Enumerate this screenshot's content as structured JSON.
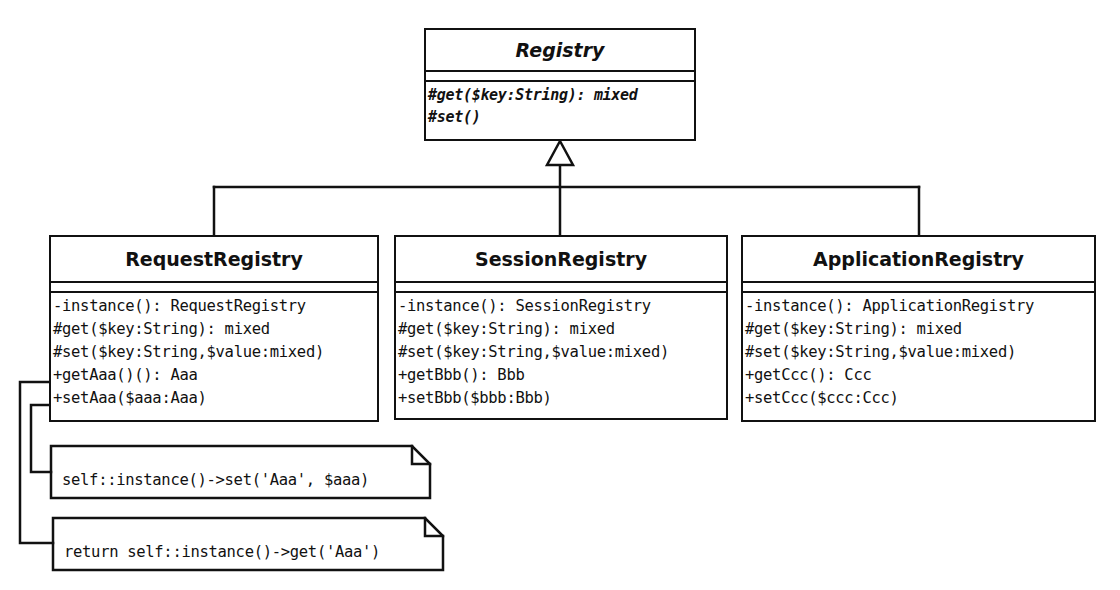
{
  "diagram": {
    "type": "UML class diagram",
    "colors": {
      "stroke": "#111111",
      "fill": "#ffffff"
    },
    "classes": {
      "registry": {
        "name": "Registry",
        "abstract": true,
        "operations": [
          "#get($key:String): mixed",
          "#set()"
        ]
      },
      "request": {
        "name": "RequestRegistry",
        "operations": [
          "-instance(): RequestRegistry",
          "#get($key:String): mixed",
          "#set($key:String,$value:mixed)",
          "+getAaa()(): Aaa",
          "+setAaa($aaa:Aaa)"
        ]
      },
      "session": {
        "name": "SessionRegistry",
        "operations": [
          "-instance(): SessionRegistry",
          "#get($key:String): mixed",
          "#set($key:String,$value:mixed)",
          "+getBbb(): Bbb",
          "+setBbb($bbb:Bbb)"
        ]
      },
      "application": {
        "name": "ApplicationRegistry",
        "operations": [
          "-instance(): ApplicationRegistry",
          "#get($key:String): mixed",
          "#set($key:String,$value:mixed)",
          "+getCcc(): Ccc",
          "+setCcc($ccc:Ccc)"
        ]
      }
    },
    "notes": [
      {
        "attached_to": "+setAaa($aaa:Aaa)",
        "text": "self::instance()->set('Aaa', $aaa)"
      },
      {
        "attached_to": "+getAaa()(): Aaa",
        "text": "return self::instance()->get('Aaa')"
      }
    ],
    "relationships": [
      {
        "type": "generalization",
        "from": "RequestRegistry",
        "to": "Registry"
      },
      {
        "type": "generalization",
        "from": "SessionRegistry",
        "to": "Registry"
      },
      {
        "type": "generalization",
        "from": "ApplicationRegistry",
        "to": "Registry"
      }
    ]
  }
}
